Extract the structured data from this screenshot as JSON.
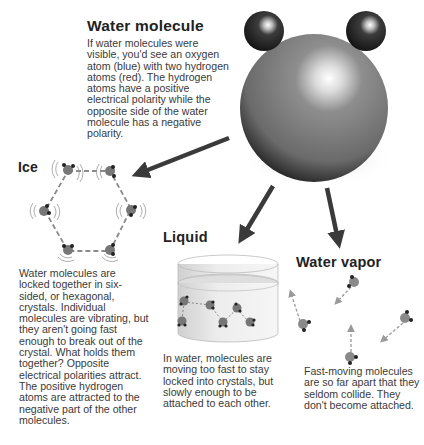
{
  "water_molecule": {
    "title": "Water molecule",
    "description": "If water molecules were visible, you'd see an oxygen atom (blue) with two hydrogen atoms (red). The hydrogen atoms have a positive electrical polarity while the opposite side of the water molecule has a negative polarity."
  },
  "ice": {
    "title": "Ice",
    "description": "Water molecules are locked together in six-sided, or hexagonal, crystals. Individual molecules are vibrating, but they aren't going fast enough to break out of the crystal. What holds them together? Opposite electrical polarities attract. The positive hydrogen atoms are attracted to the negative part of the other molecules."
  },
  "liquid": {
    "title": "Liquid",
    "description": "In water, molecules are moving too fast to stay locked into crystals, but slowly enough to be attached to each other."
  },
  "vapor": {
    "title": "Water vapor",
    "description": "Fast-moving molecules are so far apart that they seldom collide. They don't become attached."
  },
  "colors": {
    "oxygen": "#7a7a7a",
    "hydrogen": "#2a2a2a",
    "arrow": "#3a3a3a",
    "dashed": "#8a8a8a"
  }
}
